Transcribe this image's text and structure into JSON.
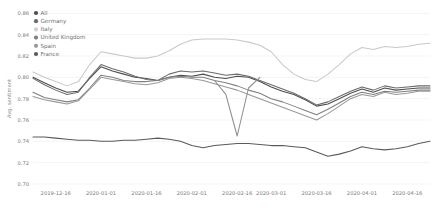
{
  "chart_data": {
    "type": "line",
    "title": "",
    "xlabel": "",
    "ylabel": "Avg. sentiment",
    "ylim": [
      0.7,
      0.865
    ],
    "yticks": [
      "0.86",
      "0.84",
      "0.82",
      "0.80",
      "0.78",
      "0.76",
      "0.74",
      "0.72",
      "0.70"
    ],
    "ytick_values": [
      0.86,
      0.84,
      0.82,
      0.8,
      0.78,
      0.76,
      0.74,
      0.72,
      0.7
    ],
    "grid": true,
    "legend_position": "top-left",
    "xticks": [
      "2019-12-16",
      "2020-01-01",
      "2020-01-16",
      "2020-02-01",
      "2020-02-16",
      "2020-03-01",
      "2020-03-16",
      "2020-04-01",
      "2020-04-16"
    ],
    "xtick_values": [
      2,
      6,
      10,
      14,
      18,
      21,
      25,
      29,
      33
    ],
    "x": [
      0,
      1,
      2,
      3,
      4,
      5,
      6,
      7,
      8,
      9,
      10,
      11,
      12,
      13,
      14,
      15,
      16,
      17,
      18,
      19,
      20,
      21,
      22,
      23,
      24,
      25,
      26,
      27,
      28,
      29,
      30,
      31,
      32,
      33,
      34,
      35
    ],
    "series": [
      {
        "name": "All",
        "color": "#4d4d4d",
        "values": [
          0.8,
          0.795,
          0.79,
          0.786,
          0.787,
          0.799,
          0.81,
          0.806,
          0.803,
          0.8,
          0.799,
          0.797,
          0.8,
          0.802,
          0.801,
          0.803,
          0.8,
          0.799,
          0.801,
          0.8,
          0.796,
          0.791,
          0.787,
          0.784,
          0.779,
          0.773,
          0.775,
          0.78,
          0.785,
          0.789,
          0.786,
          0.79,
          0.788,
          0.789,
          0.79,
          0.79
        ]
      },
      {
        "name": "Germany",
        "color": "#6b6b6b",
        "values": [
          0.799,
          0.793,
          0.788,
          0.784,
          0.786,
          0.8,
          0.812,
          0.808,
          0.805,
          0.801,
          0.798,
          0.797,
          0.803,
          0.806,
          0.805,
          0.806,
          0.804,
          0.802,
          0.803,
          0.801,
          0.797,
          0.793,
          0.789,
          0.785,
          0.78,
          0.774,
          0.777,
          0.782,
          0.787,
          0.791,
          0.788,
          0.792,
          0.79,
          0.791,
          0.792,
          0.792
        ]
      },
      {
        "name": "Italy",
        "color": "#c9c9c9",
        "values": [
          0.805,
          0.8,
          0.796,
          0.792,
          0.796,
          0.812,
          0.824,
          0.822,
          0.82,
          0.818,
          0.818,
          0.82,
          0.825,
          0.831,
          0.835,
          0.836,
          0.836,
          0.836,
          0.835,
          0.833,
          0.83,
          0.824,
          0.812,
          0.803,
          0.798,
          0.796,
          0.803,
          0.812,
          0.822,
          0.828,
          0.826,
          0.829,
          0.828,
          0.829,
          0.831,
          0.832
        ]
      },
      {
        "name": "United Kingdom",
        "color": "#808080",
        "values": [
          0.786,
          0.781,
          0.779,
          0.777,
          0.779,
          0.79,
          0.802,
          0.8,
          0.797,
          0.796,
          0.796,
          0.797,
          0.8,
          0.801,
          0.8,
          0.8,
          0.797,
          0.795,
          0.792,
          0.788,
          0.785,
          0.78,
          0.777,
          0.773,
          0.769,
          0.765,
          0.77,
          0.776,
          0.782,
          0.786,
          0.784,
          0.787,
          0.786,
          0.787,
          0.788,
          0.788
        ]
      },
      {
        "name": "Spain",
        "color": "#999999",
        "values": [
          0.782,
          0.779,
          0.777,
          0.775,
          0.778,
          0.789,
          0.8,
          0.798,
          0.796,
          0.794,
          0.793,
          0.795,
          0.799,
          0.8,
          0.799,
          0.797,
          0.794,
          0.791,
          0.788,
          0.784,
          0.78,
          0.776,
          0.772,
          0.768,
          0.764,
          0.76,
          0.766,
          0.773,
          0.78,
          0.784,
          0.782,
          0.786,
          0.784,
          0.785,
          0.787,
          0.787
        ]
      },
      {
        "name": "France",
        "color": "#5a5a5a",
        "values": [
          0.744,
          0.744,
          0.743,
          0.742,
          0.741,
          0.741,
          0.74,
          0.74,
          0.741,
          0.741,
          0.742,
          0.743,
          0.742,
          0.74,
          0.736,
          0.734,
          0.736,
          0.737,
          0.738,
          0.738,
          0.737,
          0.736,
          0.736,
          0.735,
          0.734,
          0.73,
          0.726,
          0.728,
          0.731,
          0.735,
          0.733,
          0.732,
          0.733,
          0.735,
          0.738,
          0.74
        ]
      },
      {
        "name": "spike-low",
        "color": "#8e8e8e",
        "values": [
          null,
          null,
          null,
          null,
          null,
          null,
          null,
          null,
          null,
          null,
          null,
          null,
          null,
          null,
          null,
          null,
          0.797,
          0.784,
          0.745,
          0.79,
          0.8,
          null,
          null,
          null,
          null,
          null,
          null,
          null,
          null,
          null,
          null,
          null,
          null,
          null,
          null,
          null
        ]
      }
    ],
    "legend": [
      {
        "label": "All",
        "color": "#4d4d4d"
      },
      {
        "label": "Germany",
        "color": "#6b6b6b"
      },
      {
        "label": "Italy",
        "color": "#d0d0d0"
      },
      {
        "label": "United Kingdom",
        "color": "#808080"
      },
      {
        "label": "Spain",
        "color": "#999999"
      },
      {
        "label": "France",
        "color": "#5a5a5a"
      }
    ]
  }
}
